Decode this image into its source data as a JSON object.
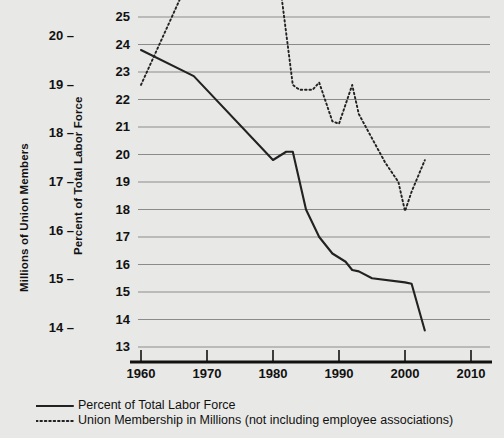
{
  "chart_data": {
    "type": "line",
    "title": "",
    "xlabel": "",
    "ylabel": "Percent of Total Labor Force",
    "ylabel_secondary": "Millions of Union Members",
    "grid": true,
    "legend_position": "bottom-left",
    "xlim": [
      1955,
      2013
    ],
    "xticks": [
      1960,
      1970,
      1980,
      1990,
      2000,
      2010
    ],
    "xticklabels": [
      "1960",
      "1970",
      "1980",
      "1990",
      "2000",
      "2010"
    ],
    "ylim": [
      13,
      25
    ],
    "yticks": [
      13,
      14,
      15,
      16,
      17,
      18,
      19,
      20,
      21,
      22,
      23,
      24,
      25
    ],
    "yticklabels": [
      "13",
      "14",
      "15",
      "16",
      "17",
      "18",
      "19",
      "20",
      "21",
      "22",
      "23",
      "24",
      "25"
    ],
    "ylim_secondary": [
      13.6,
      20.4
    ],
    "yticks_secondary": [
      14,
      15,
      16,
      17,
      18,
      19,
      20
    ],
    "yticklabels_secondary": [
      "14 –",
      "15 –",
      "16 –",
      "17 –",
      "18 –",
      "19 –",
      "20 –"
    ],
    "series": [
      {
        "name": "Percent of Total Labor Force",
        "style": "solid",
        "axis": "left",
        "color": "#222222",
        "points": [
          [
            1960,
            23.8
          ],
          [
            1968,
            22.85
          ],
          [
            1980,
            19.8
          ],
          [
            1982,
            20.1
          ],
          [
            1983,
            20.1
          ],
          [
            1985,
            18.0
          ],
          [
            1987,
            17.0
          ],
          [
            1989,
            16.4
          ],
          [
            1991,
            16.1
          ],
          [
            1992,
            15.8
          ],
          [
            1993,
            15.75
          ],
          [
            1995,
            15.5
          ],
          [
            2000,
            15.35
          ],
          [
            2001,
            15.3
          ],
          [
            2003,
            13.6
          ]
        ]
      },
      {
        "name": "Union Membership in Millions (not including employee associations)",
        "style": "dotted",
        "axis": "right",
        "color": "#222222",
        "points": [
          [
            1960,
            19.0
          ],
          [
            1970,
            22.0
          ],
          [
            1977,
            24.8
          ],
          [
            1978,
            24.8
          ],
          [
            1980,
            22.2
          ],
          [
            1983,
            19.0
          ],
          [
            1984,
            18.9
          ],
          [
            1986,
            18.9
          ],
          [
            1987,
            19.05
          ],
          [
            1989,
            18.25
          ],
          [
            1990,
            18.2
          ],
          [
            1991,
            18.6
          ],
          [
            1992,
            19.0
          ],
          [
            1993,
            18.4
          ],
          [
            1995,
            17.9
          ],
          [
            1997,
            17.4
          ],
          [
            1999,
            17.0
          ],
          [
            2000,
            16.4
          ],
          [
            2001,
            16.8
          ],
          [
            2003,
            17.45
          ]
        ]
      }
    ]
  },
  "legend": {
    "items": [
      {
        "label": "Percent of Total Labor Force",
        "style": "solid"
      },
      {
        "label": "Union Membership in Millions (not including employee associations)",
        "style": "dotted"
      }
    ]
  }
}
